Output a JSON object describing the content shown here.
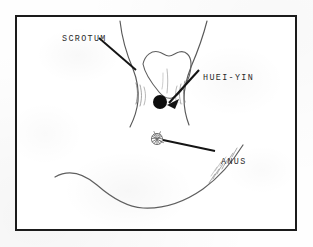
{
  "figure": {
    "type": "anatomical-line-drawing",
    "frame": {
      "border_color": "#1b1b1b",
      "background": "#ffffff"
    },
    "paper_background": "#fefefe",
    "ink_color": "#4a4a4a",
    "marker_color": "#0d0d0d"
  },
  "labels": [
    {
      "id": "scrotum",
      "text": "SCROTUM",
      "pointer": "leader-line",
      "points_to": "scrotum-outline"
    },
    {
      "id": "huei_yin",
      "text": "HUEI-YIN",
      "pointer": "arrow",
      "points_to": "huei-yin-point-marker"
    },
    {
      "id": "anus",
      "text": "ANUS",
      "pointer": "leader-line",
      "points_to": "anus-marking"
    }
  ],
  "markers": {
    "huei_yin_point": {
      "shape": "filled-circle",
      "color": "#0d0d0d",
      "center": {
        "x": 158,
        "y": 100
      },
      "radius": 7
    },
    "anus": {
      "shape": "radial-scribble",
      "color": "#5a5a5a",
      "center": {
        "x": 155,
        "y": 137
      },
      "radius": 7
    }
  }
}
